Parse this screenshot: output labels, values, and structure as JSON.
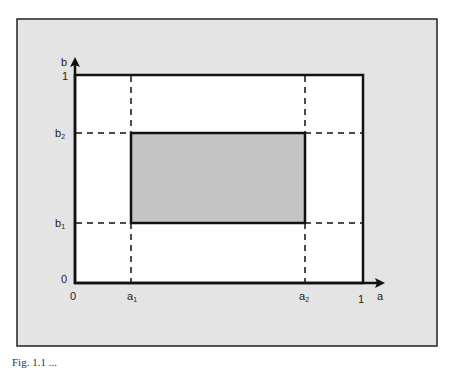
{
  "diagram": {
    "type": "unit-square-region",
    "colors": {
      "page_background": "#ffffff",
      "frame_background": "#e4e4e4",
      "frame_border": "#222222",
      "unit_square_fill": "#ffffff",
      "shaded_region_fill": "#c4c4c4",
      "line": "#111111"
    },
    "axes": {
      "x_label": "a",
      "y_label": "b",
      "origin_x_label": "0",
      "origin_y_label": "0",
      "x_max_label": "1",
      "y_max_label": "1"
    },
    "x_ticks": [
      {
        "base": "a",
        "sub": "1"
      },
      {
        "base": "a",
        "sub": "2"
      }
    ],
    "y_ticks": [
      {
        "base": "b",
        "sub": "2"
      },
      {
        "base": "b",
        "sub": "1"
      }
    ],
    "shaded_region": {
      "description": "rectangle [a1, a2] × [b1, b2] inside the unit square"
    }
  },
  "caption": {
    "text": "Fig. 1.1 ..."
  }
}
